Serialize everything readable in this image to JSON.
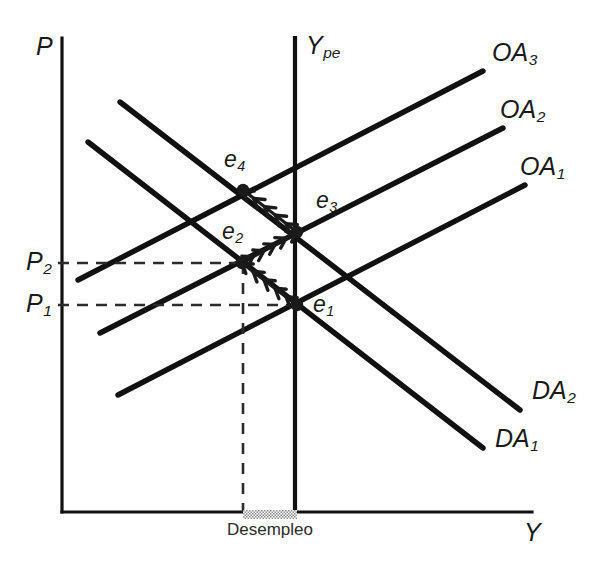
{
  "figure": {
    "type": "economics-diagram",
    "language": "es"
  },
  "axes": {
    "y_axis_label": "P",
    "x_axis_label": "Y",
    "origin": [
      62,
      512
    ],
    "x_axis_end": [
      532,
      512
    ],
    "y_axis_top": [
      62,
      38
    ]
  },
  "potential_output": {
    "label_main": "Y",
    "label_sub": "pe",
    "x": 295,
    "top": 38,
    "bottom": 512
  },
  "price_levels": [
    {
      "id": "P2",
      "main": "P",
      "sub": "2",
      "y": 263,
      "dash_to_x": 243
    },
    {
      "id": "P1",
      "main": "P",
      "sub": "1",
      "y": 305,
      "dash_to_x": 297
    }
  ],
  "supply_curves": [
    {
      "id": "OA1",
      "main": "OA",
      "sub": "1",
      "x1": 118,
      "y1": 395,
      "x2": 525,
      "y2": 185,
      "label_x": 520,
      "label_y": 168
    },
    {
      "id": "OA2",
      "main": "OA",
      "sub": "2",
      "x1": 100,
      "y1": 333,
      "x2": 503,
      "y2": 128,
      "label_x": 500,
      "label_y": 111
    },
    {
      "id": "OA3",
      "main": "OA",
      "sub": "3",
      "x1": 78,
      "y1": 280,
      "x2": 483,
      "y2": 71,
      "label_x": 492,
      "label_y": 54
    }
  ],
  "demand_curves": [
    {
      "id": "DA1",
      "main": "DA",
      "sub": "1",
      "x1": 88,
      "y1": 142,
      "x2": 483,
      "y2": 448,
      "label_x": 495,
      "label_y": 440
    },
    {
      "id": "DA2",
      "main": "DA",
      "sub": "2",
      "x1": 120,
      "y1": 102,
      "x2": 520,
      "y2": 410,
      "label_x": 532,
      "label_y": 392
    }
  ],
  "equilibria": [
    {
      "id": "e1",
      "main": "e",
      "sub": "1",
      "x": 297,
      "y": 305,
      "label_x": 313,
      "label_y": 305
    },
    {
      "id": "e2",
      "main": "e",
      "sub": "2",
      "x": 242,
      "y": 263,
      "label_x": 222,
      "label_y": 232
    },
    {
      "id": "e3",
      "main": "e",
      "sub": "3",
      "x": 297,
      "y": 232,
      "label_x": 316,
      "label_y": 201
    },
    {
      "id": "e4",
      "main": "e",
      "sub": "4",
      "x": 243,
      "y": 190,
      "label_x": 224,
      "label_y": 160
    }
  ],
  "adjustment_path": {
    "description": "zigzag adjustment from e1 to e4",
    "segments": [
      {
        "from": "e1",
        "to": "e2"
      },
      {
        "from": "e2",
        "to": "e3"
      },
      {
        "from": "e3",
        "to": "e4"
      }
    ]
  },
  "unemployment_gap": {
    "label": "Desempleo",
    "bar_x1": 243,
    "bar_x2": 297,
    "bar_y": 510,
    "label_x": 270,
    "label_y": 530,
    "dashed_drop_x": 243,
    "dashed_drop_from_y": 263,
    "dashed_drop_to_y": 512
  },
  "colors": {
    "ink": "#1a1a1a",
    "line": "#111111",
    "dash": "#2b2b2b",
    "hatch": "#9a9a9a",
    "background": "#ffffff"
  }
}
